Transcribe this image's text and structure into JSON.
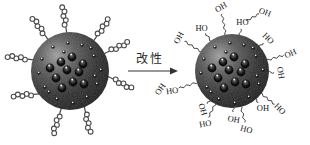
{
  "arrow": {
    "label": "改性"
  },
  "colors": {
    "background": "#ffffff",
    "coil_chain": "#4a4a4a",
    "zigzag_chain": "#2e2e2e",
    "label_text": "#161616",
    "arrow": "#333333"
  },
  "left_particle": {
    "cx": 70,
    "cy": 71,
    "r": 39,
    "coil_chains": [
      {
        "a": -125
      },
      {
        "a": -95,
        "dir": -98
      },
      {
        "a": -52,
        "dir": -55
      },
      {
        "a": -27,
        "dir": -25
      },
      {
        "a": 8,
        "dir": 27
      },
      {
        "a": -163,
        "dir": -172
      },
      {
        "a": 143,
        "dir": 176
      },
      {
        "a": 103,
        "dir": 108
      },
      {
        "a": 68,
        "dir": 78
      }
    ]
  },
  "right_particle": {
    "cx": 232,
    "cy": 71,
    "r": 37,
    "zigzag_chains": [
      {
        "a": -100,
        "len": 22,
        "label": "OH",
        "rot": -30
      },
      {
        "a": -125,
        "len": 10,
        "label": "HO",
        "rot": 0
      },
      {
        "a": -148,
        "len": 20,
        "label": "OH",
        "rot": -62
      },
      {
        "a": -78,
        "len": 7,
        "label": "HO",
        "rot": 0
      },
      {
        "a": -42,
        "len": 6,
        "label": "HO",
        "rot": 45
      },
      {
        "a": -17,
        "len": 18,
        "label": "OH",
        "rot": -25
      },
      {
        "a": 2,
        "len": 6,
        "label": "OH",
        "rot": 80
      },
      {
        "a": 38,
        "len": 18,
        "label": "HO",
        "rot": 45
      },
      {
        "a": 50,
        "len": 5,
        "label": "OH",
        "rot": 0
      },
      {
        "a": 76,
        "len": 17,
        "label": "HO",
        "rot": 15
      },
      {
        "a": 88,
        "len": 5,
        "label": "OH",
        "rot": 10
      },
      {
        "a": 117,
        "len": 16,
        "label": "HO",
        "rot": -10
      },
      {
        "a": 162,
        "len": 20,
        "label": "HO",
        "rot": -8
      },
      {
        "a": 127,
        "len": 5,
        "label": "OH",
        "rot": 75
      }
    ],
    "extra_zigzags": [
      {
        "x1": 246,
        "y1": 21,
        "x2": 259,
        "y2": 14,
        "label": "OH",
        "lx": 265,
        "ly": 12,
        "rot": 20
      }
    ],
    "extra_labels": [
      {
        "label": "OH",
        "x": 160,
        "y": 89,
        "rot": -55
      }
    ]
  },
  "inner_spheres": [
    [
      -20,
      -3
    ],
    [
      -9,
      -9
    ],
    [
      2,
      -14
    ],
    [
      13,
      -7
    ],
    [
      -14,
      7
    ],
    [
      -3,
      -1
    ],
    [
      9,
      1
    ],
    [
      -8,
      17
    ],
    [
      3,
      11
    ],
    [
      14,
      13
    ]
  ],
  "small_dots": [
    [
      -2,
      -28
    ],
    [
      12,
      -26
    ],
    [
      24,
      -15
    ],
    [
      31,
      -1
    ],
    [
      27,
      13
    ],
    [
      17,
      26
    ],
    [
      3,
      32
    ],
    [
      -13,
      28
    ],
    [
      -25,
      16
    ],
    [
      -31,
      2
    ],
    [
      -28,
      -12
    ],
    [
      -17,
      -24
    ],
    [
      21,
      -23
    ],
    [
      -21,
      21
    ],
    [
      25,
      5
    ],
    [
      -6,
      -19
    ]
  ]
}
